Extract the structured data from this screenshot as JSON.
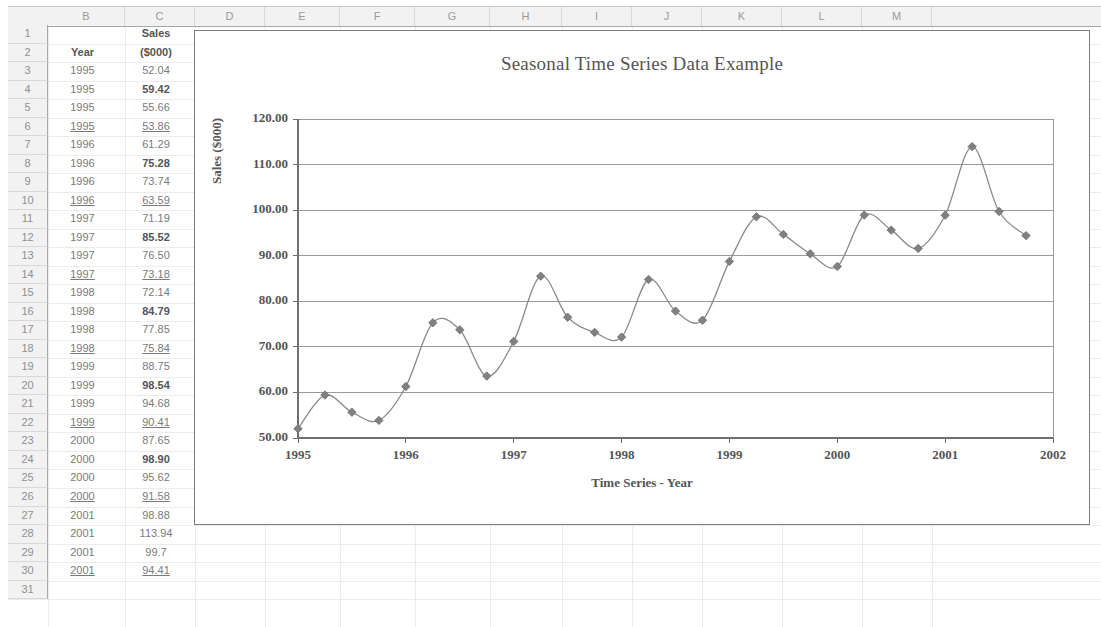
{
  "spreadsheet": {
    "columns": [
      "B",
      "C",
      "D",
      "E",
      "F",
      "G",
      "H",
      "I",
      "J",
      "K",
      "L",
      "M"
    ],
    "rows": [
      "1",
      "2",
      "3",
      "4",
      "5",
      "6",
      "7",
      "8",
      "9",
      "10",
      "11",
      "12",
      "13",
      "14",
      "15",
      "16",
      "17",
      "18",
      "19",
      "20",
      "21",
      "22",
      "23",
      "24",
      "25",
      "26",
      "27",
      "28",
      "29",
      "30",
      "31"
    ],
    "header_r1": {
      "c": "Sales"
    },
    "header_r2": {
      "b": "Year",
      "c": "($000)"
    },
    "data": [
      {
        "row": "3",
        "year": "1995",
        "sales": "52.04",
        "bold": false,
        "underline": false
      },
      {
        "row": "4",
        "year": "1995",
        "sales": "59.42",
        "bold": true,
        "underline": false
      },
      {
        "row": "5",
        "year": "1995",
        "sales": "55.66",
        "bold": false,
        "underline": false
      },
      {
        "row": "6",
        "year": "1995",
        "sales": "53.86",
        "bold": false,
        "underline": true
      },
      {
        "row": "7",
        "year": "1996",
        "sales": "61.29",
        "bold": false,
        "underline": false
      },
      {
        "row": "8",
        "year": "1996",
        "sales": "75.28",
        "bold": true,
        "underline": false
      },
      {
        "row": "9",
        "year": "1996",
        "sales": "73.74",
        "bold": false,
        "underline": false
      },
      {
        "row": "10",
        "year": "1996",
        "sales": "63.59",
        "bold": false,
        "underline": true
      },
      {
        "row": "11",
        "year": "1997",
        "sales": "71.19",
        "bold": false,
        "underline": false
      },
      {
        "row": "12",
        "year": "1997",
        "sales": "85.52",
        "bold": true,
        "underline": false
      },
      {
        "row": "13",
        "year": "1997",
        "sales": "76.50",
        "bold": false,
        "underline": false
      },
      {
        "row": "14",
        "year": "1997",
        "sales": "73.18",
        "bold": false,
        "underline": true
      },
      {
        "row": "15",
        "year": "1998",
        "sales": "72.14",
        "bold": false,
        "underline": false
      },
      {
        "row": "16",
        "year": "1998",
        "sales": "84.79",
        "bold": true,
        "underline": false
      },
      {
        "row": "17",
        "year": "1998",
        "sales": "77.85",
        "bold": false,
        "underline": false
      },
      {
        "row": "18",
        "year": "1998",
        "sales": "75.84",
        "bold": false,
        "underline": true
      },
      {
        "row": "19",
        "year": "1999",
        "sales": "88.75",
        "bold": false,
        "underline": false
      },
      {
        "row": "20",
        "year": "1999",
        "sales": "98.54",
        "bold": true,
        "underline": false
      },
      {
        "row": "21",
        "year": "1999",
        "sales": "94.68",
        "bold": false,
        "underline": false
      },
      {
        "row": "22",
        "year": "1999",
        "sales": "90.41",
        "bold": false,
        "underline": true
      },
      {
        "row": "23",
        "year": "2000",
        "sales": "87.65",
        "bold": false,
        "underline": false
      },
      {
        "row": "24",
        "year": "2000",
        "sales": "98.90",
        "bold": true,
        "underline": false
      },
      {
        "row": "25",
        "year": "2000",
        "sales": "95.62",
        "bold": false,
        "underline": false
      },
      {
        "row": "26",
        "year": "2000",
        "sales": "91.58",
        "bold": false,
        "underline": true
      },
      {
        "row": "27",
        "year": "2001",
        "sales": "98.88",
        "bold": false,
        "underline": false
      },
      {
        "row": "28",
        "year": "2001",
        "sales": "113.94",
        "bold": false,
        "underline": false
      },
      {
        "row": "29",
        "year": "2001",
        "sales": "99.7",
        "bold": false,
        "underline": false
      },
      {
        "row": "30",
        "year": "2001",
        "sales": "94.41",
        "bold": false,
        "underline": true
      }
    ]
  },
  "chart_data": {
    "type": "line",
    "title": "Seasonal Time Series Data Example",
    "xlabel": "Time Series - Year",
    "ylabel": "Sales ($000)",
    "grid": true,
    "legend": "none",
    "marker": "diamond",
    "line_color": "#8a8a8a",
    "marker_color": "#808080",
    "ylim": [
      50,
      120
    ],
    "yticks": [
      "50.00",
      "60.00",
      "70.00",
      "80.00",
      "90.00",
      "100.00",
      "110.00",
      "120.00"
    ],
    "ytick_values": [
      50,
      60,
      70,
      80,
      90,
      100,
      110,
      120
    ],
    "xlim": [
      1995,
      2002
    ],
    "xticks": [
      "1995",
      "1996",
      "1997",
      "1998",
      "1999",
      "2000",
      "2001",
      "2002"
    ],
    "xtick_values": [
      1995,
      1996,
      1997,
      1998,
      1999,
      2000,
      2001,
      2002
    ],
    "x": [
      1995.0,
      1995.25,
      1995.5,
      1995.75,
      1996.0,
      1996.25,
      1996.5,
      1996.75,
      1997.0,
      1997.25,
      1997.5,
      1997.75,
      1998.0,
      1998.25,
      1998.5,
      1998.75,
      1999.0,
      1999.25,
      1999.5,
      1999.75,
      2000.0,
      2000.25,
      2000.5,
      2000.75,
      2001.0,
      2001.25,
      2001.5,
      2001.75
    ],
    "values": [
      52.04,
      59.42,
      55.66,
      53.86,
      61.29,
      75.28,
      73.74,
      63.59,
      71.19,
      85.52,
      76.5,
      73.18,
      72.14,
      84.79,
      77.85,
      75.84,
      88.75,
      98.54,
      94.68,
      90.41,
      87.65,
      98.9,
      95.62,
      91.58,
      98.88,
      113.94,
      99.7,
      94.41
    ],
    "series_name": "Sales ($000)"
  }
}
